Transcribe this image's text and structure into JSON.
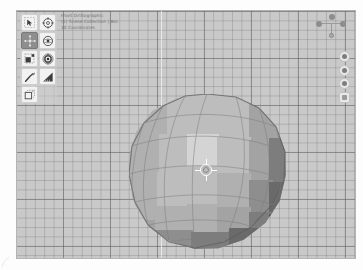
{
  "app": {
    "name": "Blender 3D Viewport",
    "viewport_bg": "#c9c9c9",
    "grid_color": "#787878"
  },
  "viewport_info": {
    "line1": "Front Orthographic",
    "line2": "(1) Scene Collection | Bin",
    "line3": "10 Coordinates"
  },
  "toolbar": {
    "items": [
      {
        "id": "tweak",
        "label": "Tweak",
        "icon": "cursor-arrow-icon",
        "active": false
      },
      {
        "id": "cursor",
        "label": "Cursor",
        "icon": "crosshair-target-icon",
        "active": false
      },
      {
        "id": "move",
        "label": "Move",
        "icon": "move-arrows-icon",
        "active": true
      },
      {
        "id": "rotate",
        "label": "Rotate",
        "icon": "rotate-gizmo-icon",
        "active": false
      },
      {
        "id": "scale",
        "label": "Scale",
        "icon": "scale-corner-icon",
        "active": false
      },
      {
        "id": "transform",
        "label": "Transform",
        "icon": "transform-rings-icon",
        "active": false
      },
      {
        "id": "annotate",
        "label": "Annotate",
        "icon": "pencil-icon",
        "active": false
      },
      {
        "id": "measure",
        "label": "Measure",
        "icon": "ruler-angle-icon",
        "active": false
      },
      {
        "id": "addcube",
        "label": "Add Cube",
        "icon": "add-cube-icon",
        "active": false
      }
    ]
  },
  "nav_gizmo": {
    "label": "Navigation Gizmo",
    "axes": [
      {
        "id": "x",
        "label": "X"
      },
      {
        "id": "y",
        "label": "Y"
      },
      {
        "id": "z",
        "label": "Z"
      }
    ]
  },
  "nav_buttons": {
    "items": [
      {
        "id": "zoom",
        "label": "Zoom Region",
        "icon": "zoom-icon"
      },
      {
        "id": "pan",
        "label": "Move View",
        "icon": "hand-pan-icon"
      },
      {
        "id": "camera",
        "label": "Toggle Camera View",
        "icon": "camera-icon"
      },
      {
        "id": "projection",
        "label": "Toggle Projection",
        "icon": "projection-icon"
      }
    ]
  },
  "scene": {
    "object_name": "Sphere",
    "object_type": "UV Sphere",
    "shading": "Solid",
    "cursor_label": "3D Cursor",
    "origin_label": "Object Origin"
  }
}
